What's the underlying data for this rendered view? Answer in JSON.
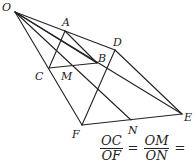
{
  "figure": {
    "type": "geometry",
    "points": {
      "O": {
        "x": 15,
        "y": 12,
        "lx": 2,
        "ly": 11
      },
      "A": {
        "x": 65,
        "y": 31,
        "lx": 62,
        "ly": 26
      },
      "D": {
        "x": 115,
        "y": 50,
        "lx": 113,
        "ly": 46
      },
      "B": {
        "x": 97,
        "y": 63,
        "lx": 98,
        "ly": 62
      },
      "C": {
        "x": 49,
        "y": 68,
        "lx": 35,
        "ly": 80
      },
      "M": {
        "x": 59,
        "y": 66,
        "lx": 61,
        "ly": 80
      },
      "E": {
        "x": 182,
        "y": 114,
        "lx": 184,
        "ly": 121
      },
      "F": {
        "x": 82,
        "y": 125,
        "lx": 72,
        "ly": 138
      },
      "N": {
        "x": 131,
        "y": 120,
        "lx": 128,
        "ly": 134
      }
    },
    "labels": [
      "O",
      "A",
      "D",
      "B",
      "C",
      "M",
      "E",
      "F",
      "N"
    ],
    "segments": [
      [
        "O",
        "D"
      ],
      [
        "O",
        "F"
      ],
      [
        "O",
        "B"
      ],
      [
        "O",
        "E"
      ],
      [
        "O",
        "N"
      ],
      [
        "A",
        "C"
      ],
      [
        "A",
        "B"
      ],
      [
        "C",
        "B"
      ],
      [
        "D",
        "F"
      ],
      [
        "D",
        "E"
      ],
      [
        "F",
        "E"
      ]
    ]
  },
  "formula": {
    "frac1": {
      "num": "OC",
      "den": "OF"
    },
    "frac2": {
      "num": "OM",
      "den": "ON"
    },
    "eq": "=",
    "tail": "="
  }
}
